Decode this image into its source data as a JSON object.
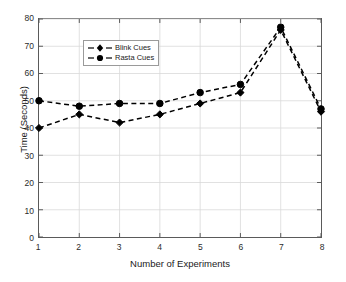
{
  "chart_data": {
    "type": "line",
    "title": "",
    "xlabel": "Number of Experiments",
    "ylabel": "Time (Seconds)",
    "x": [
      1,
      2,
      3,
      4,
      5,
      6,
      7,
      8
    ],
    "xtick_labels": [
      "1",
      "2",
      "3",
      "4",
      "5",
      "6",
      "7",
      "8"
    ],
    "ytick_labels": [
      "0",
      "10",
      "20",
      "30",
      "40",
      "50",
      "60",
      "70",
      "80"
    ],
    "yticks": [
      0,
      10,
      20,
      30,
      40,
      50,
      60,
      70,
      80
    ],
    "xlim": [
      1,
      8
    ],
    "ylim": [
      0,
      80
    ],
    "grid": true,
    "legend_position": "upper left",
    "series": [
      {
        "name": "Blink Cues",
        "marker": "diamond",
        "linestyle": "dashed",
        "color": "#000000",
        "values": [
          40,
          45,
          42,
          45,
          49,
          53,
          76,
          46
        ]
      },
      {
        "name": "Rasta Cues",
        "marker": "circle",
        "linestyle": "dashed",
        "color": "#000000",
        "values": [
          50,
          48,
          49,
          49,
          53,
          56,
          77,
          47
        ]
      }
    ]
  },
  "figure": {
    "background_color": "#ffffff",
    "grid_color": "#d9d9d9",
    "axis_color": "#5a5a5a"
  }
}
